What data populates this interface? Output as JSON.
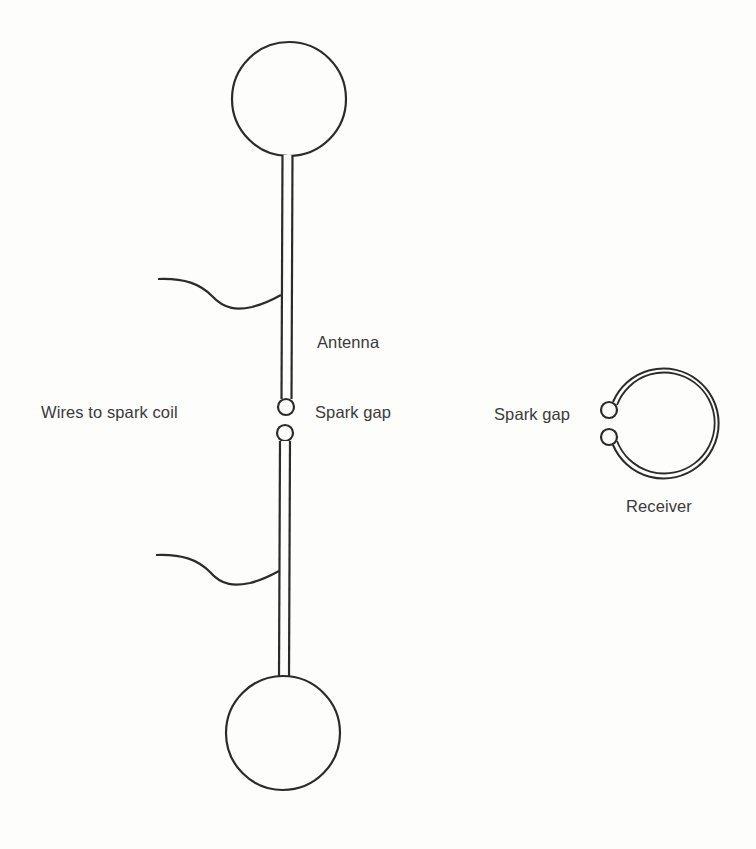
{
  "figure": {
    "type": "schematic",
    "stroke_color": "#2b2b2b",
    "text_color": "#3a3a3a",
    "background": "#fdfdfc"
  },
  "labels": {
    "antenna": "Antenna",
    "wires": "Wires to spark coil",
    "transmitter_spark_gap": "Spark gap",
    "receiver_spark_gap": "Spark gap",
    "receiver": "Receiver"
  },
  "components": {
    "top_sphere": {
      "cx": 289,
      "cy": 99,
      "rx": 57,
      "ry": 57
    },
    "bottom_sphere": {
      "cx": 283,
      "cy": 733,
      "rx": 57,
      "ry": 57
    },
    "upper_rod": {
      "x1": 282,
      "x2": 293,
      "y1": 156,
      "y2": 399
    },
    "lower_rod": {
      "x1": 279,
      "x2": 290,
      "y1": 441,
      "y2": 677
    },
    "upper_gap_ball": {
      "cx": 286,
      "cy": 407,
      "r": 8
    },
    "lower_gap_ball": {
      "cx": 285,
      "cy": 433,
      "r": 8
    },
    "receiver_ring": {
      "cx": 663,
      "cy": 422,
      "r": 55
    },
    "receiver_upper_ball": {
      "cx": 609,
      "cy": 410,
      "r": 8
    },
    "receiver_lower_ball": {
      "cx": 609,
      "cy": 437,
      "r": 8
    }
  }
}
